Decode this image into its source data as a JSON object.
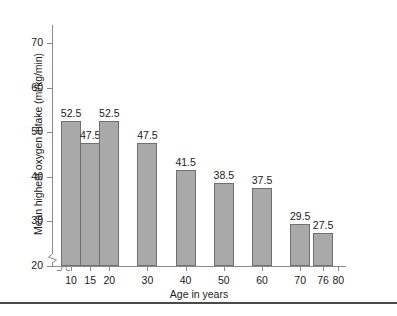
{
  "chart_data": {
    "type": "bar",
    "title": "",
    "xlabel": "Age in years",
    "ylabel": "Mean highest oxygen intake (ml/kg/min)",
    "categories": [
      "10",
      "15",
      "20",
      "30",
      "40",
      "50",
      "60",
      "70",
      "76"
    ],
    "values": [
      52.5,
      47.5,
      52.5,
      47.5,
      41.5,
      38.5,
      37.5,
      29.5,
      27.5
    ],
    "value_labels": [
      "52.5",
      "47.5",
      "52.5",
      "47.5",
      "41.5",
      "38.5",
      "37.5",
      "29.5",
      "27.5"
    ],
    "x_tick_labels": [
      "10",
      "15",
      "20",
      "30",
      "40",
      "50",
      "60",
      "70",
      "76",
      "80"
    ],
    "y_tick_labels": [
      "20",
      "30",
      "40",
      "50",
      "60",
      "70"
    ],
    "y_ticks": [
      20,
      30,
      40,
      50,
      60,
      70
    ],
    "ylim": [
      20,
      70
    ],
    "xlim": [
      5,
      82
    ],
    "axis_break_y": true,
    "axis_break_x": true,
    "grid": false,
    "legend": false,
    "bar_color": "#a9a9a9",
    "bar_edge_color": "#707070",
    "axis_color": "#8a8a8a",
    "text_color": "#1a1a1a",
    "background": "#ffffff"
  },
  "caption": {
    "rule_color": "#4a4a4a",
    "text": ""
  }
}
